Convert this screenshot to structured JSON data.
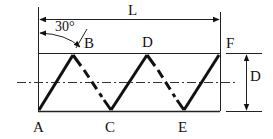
{
  "diagram": {
    "type": "helical-winding-pattern",
    "labels": {
      "angle": "30°",
      "length": "L",
      "diameter": "D",
      "points": [
        "A",
        "B",
        "C",
        "D",
        "E",
        "F"
      ]
    },
    "points": {
      "A": {
        "label": "A"
      },
      "B": {
        "label": "B"
      },
      "C": {
        "label": "C"
      },
      "D": {
        "label": "D"
      },
      "E": {
        "label": "E"
      },
      "F": {
        "label": "F"
      }
    },
    "colors": {
      "line": "#111111",
      "background": "#ffffff"
    }
  }
}
